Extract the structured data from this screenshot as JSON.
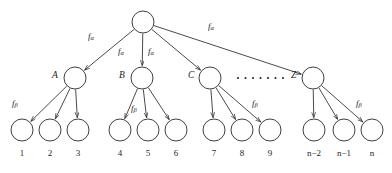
{
  "diagram": {
    "type": "tree-hierarchy",
    "title": "",
    "root": {
      "label": "",
      "cx": 143,
      "cy": 22,
      "r": 11
    },
    "level2_nodes": [
      {
        "id": "A",
        "label": "A",
        "cx": 75,
        "cy": 78,
        "r": 11,
        "label_x": 52,
        "label_y": 71
      },
      {
        "id": "B",
        "label": "B",
        "cx": 142,
        "cy": 78,
        "r": 11,
        "label_x": 119,
        "label_y": 71
      },
      {
        "id": "C",
        "label": "C",
        "cx": 210,
        "cy": 78,
        "r": 11,
        "label_x": 188,
        "label_y": 71
      },
      {
        "id": "Z",
        "label": "Z",
        "cx": 313,
        "cy": 78,
        "r": 11,
        "label_x": 291,
        "label_y": 71
      }
    ],
    "ellipsis": {
      "dots": 7,
      "x_start": 238,
      "x_step": 7.5,
      "y": 78,
      "radius": 1.1
    },
    "leaf_nodes": [
      {
        "label": "1",
        "cx": 22,
        "cy": 130,
        "r": 11,
        "parent": "A"
      },
      {
        "label": "2",
        "cx": 50,
        "cy": 130,
        "r": 11,
        "parent": "A"
      },
      {
        "label": "3",
        "cx": 78,
        "cy": 130,
        "r": 11,
        "parent": "A"
      },
      {
        "label": "4",
        "cx": 120,
        "cy": 130,
        "r": 11,
        "parent": "B"
      },
      {
        "label": "5",
        "cx": 148,
        "cy": 130,
        "r": 11,
        "parent": "B"
      },
      {
        "label": "6",
        "cx": 176,
        "cy": 130,
        "r": 11,
        "parent": "B"
      },
      {
        "label": "7",
        "cx": 214,
        "cy": 130,
        "r": 11,
        "parent": "C"
      },
      {
        "label": "8",
        "cx": 242,
        "cy": 130,
        "r": 11,
        "parent": "C"
      },
      {
        "label": "9",
        "cx": 270,
        "cy": 130,
        "r": 11,
        "parent": "C"
      },
      {
        "label": "n−2",
        "cx": 314,
        "cy": 130,
        "r": 11,
        "parent": "Z"
      },
      {
        "label": "n−1",
        "cx": 344,
        "cy": 130,
        "r": 11,
        "parent": "Z"
      },
      {
        "label": "n",
        "cx": 372,
        "cy": 130,
        "r": 11,
        "parent": "Z"
      }
    ],
    "leaf_label_y": 149,
    "edge_labels": {
      "alpha": {
        "glyph": "f",
        "subscript": "α",
        "instances": [
          {
            "x": 88,
            "y": 32
          },
          {
            "x": 118,
            "y": 47
          },
          {
            "x": 148,
            "y": 47
          },
          {
            "x": 208,
            "y": 22
          }
        ]
      },
      "beta": {
        "glyph": "f",
        "subscript": "β",
        "instances": [
          {
            "x": 12,
            "y": 99
          },
          {
            "x": 131,
            "y": 104
          },
          {
            "x": 252,
            "y": 99
          },
          {
            "x": 356,
            "y": 99
          }
        ]
      }
    },
    "colors": {
      "stroke": "#2a2a2a",
      "text": "#1d1d1d",
      "background": "#ffffff"
    }
  }
}
